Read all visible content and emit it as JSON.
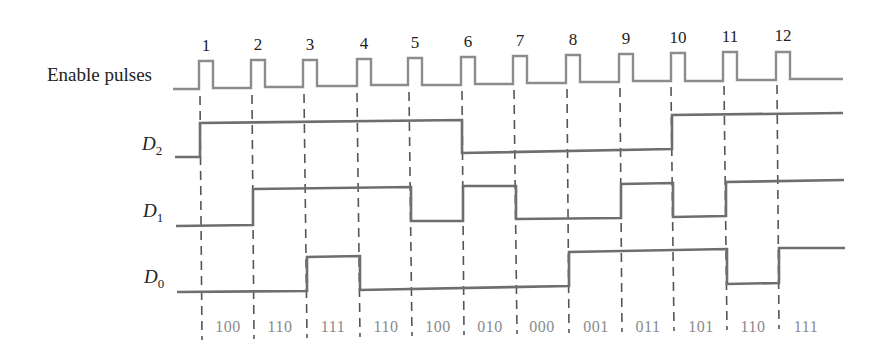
{
  "diagram": {
    "signals": {
      "enable": {
        "label": "Enable pulses"
      },
      "d2": {
        "label": "D",
        "sub": "2"
      },
      "d1": {
        "label": "D",
        "sub": "1"
      },
      "d0": {
        "label": "D",
        "sub": "0"
      }
    },
    "pulse_numbers": [
      "1",
      "2",
      "3",
      "4",
      "5",
      "6",
      "7",
      "8",
      "9",
      "10",
      "11",
      "12"
    ],
    "state_labels": [
      "100",
      "110",
      "111",
      "110",
      "100",
      "010",
      "000",
      "001",
      "011",
      "101",
      "110",
      "111"
    ],
    "colors": {
      "enable_trace": "#8c8c8c",
      "data_trace": "#6e6e6e",
      "dashed_line": "#555555",
      "state_text": "#8a8a8a",
      "label_text": "#222222"
    },
    "timing": {
      "d2_levels_after_pulse": [
        1,
        1,
        1,
        1,
        1,
        0,
        0,
        0,
        0,
        1,
        1,
        1
      ],
      "d1_levels_after_pulse": [
        0,
        1,
        1,
        1,
        0,
        1,
        0,
        0,
        1,
        0,
        1,
        1
      ],
      "d0_levels_after_pulse": [
        0,
        0,
        1,
        0,
        0,
        0,
        0,
        1,
        1,
        1,
        0,
        1
      ]
    }
  }
}
